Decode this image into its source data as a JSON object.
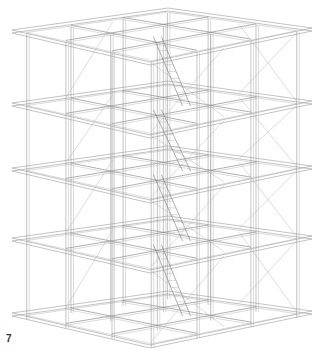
{
  "figure": {
    "label": "7",
    "levels": 5,
    "grid": 3
  },
  "geometry": {
    "left": [
      12,
      105
    ],
    "front": [
      150,
      135
    ],
    "right": [
      312,
      100
    ],
    "back": [
      168,
      62
    ],
    "level_offsets": [
      0,
      73,
      138,
      208,
      283
    ],
    "top_shift": -68,
    "colors": {
      "line": "#9a9a9a",
      "light": "#b8b8b8",
      "dark": "#7a7a7a"
    }
  }
}
